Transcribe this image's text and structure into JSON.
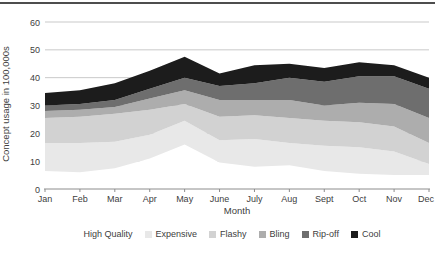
{
  "page": {
    "top_rule_color": "#4D4D4D"
  },
  "chart_data": {
    "type": "area",
    "stacked": true,
    "title": "",
    "xlabel": "Month",
    "ylabel": "Concept usage in 100,000s",
    "categories": [
      "Jan",
      "Feb",
      "Mar",
      "Apr",
      "May",
      "June",
      "July",
      "Aug",
      "Sept",
      "Oct",
      "Nov",
      "Dec"
    ],
    "series": [
      {
        "name": "High Quality",
        "color": "#FFFFFF",
        "values": [
          6.5,
          6,
          7.5,
          11,
          16,
          9.5,
          8,
          8.5,
          6.5,
          5.5,
          5,
          5
        ]
      },
      {
        "name": "Expensive",
        "color": "#E8E8E8",
        "values": [
          10,
          10.5,
          9.5,
          8.5,
          8.5,
          8,
          10,
          8,
          9,
          9.5,
          8.5,
          4
        ]
      },
      {
        "name": "Flashy",
        "color": "#D2D2D2",
        "values": [
          9,
          9.5,
          10,
          9,
          6,
          8.5,
          8.5,
          9,
          9,
          9,
          9,
          7.5
        ]
      },
      {
        "name": "Bling",
        "color": "#ADADAD",
        "values": [
          2.5,
          2.5,
          2.5,
          4,
          5,
          6,
          5.5,
          6.5,
          5.5,
          7,
          8,
          9
        ]
      },
      {
        "name": "Rip-off",
        "color": "#6E6E6E",
        "values": [
          2,
          2,
          2.5,
          3.5,
          4.5,
          5,
          6,
          8,
          8.5,
          9.5,
          10,
          10.5
        ]
      },
      {
        "name": "Cool",
        "color": "#1C1C1C",
        "values": [
          4.5,
          5,
          6,
          6.5,
          7.5,
          4.5,
          6.5,
          5,
          5,
          5,
          4,
          4
        ]
      }
    ],
    "totals": [
      34.5,
      35.5,
      38,
      42.5,
      47.5,
      41.5,
      44.5,
      45,
      43.5,
      45.5,
      44.5,
      40
    ],
    "ylim": [
      0,
      60
    ],
    "yticks": [
      0,
      10,
      20,
      30,
      40,
      50,
      60
    ],
    "grid": true,
    "legend_position": "bottom",
    "colors": {
      "gridline": "#C9C9C9",
      "axis": "#8C8C8C",
      "text": "#404040"
    }
  }
}
